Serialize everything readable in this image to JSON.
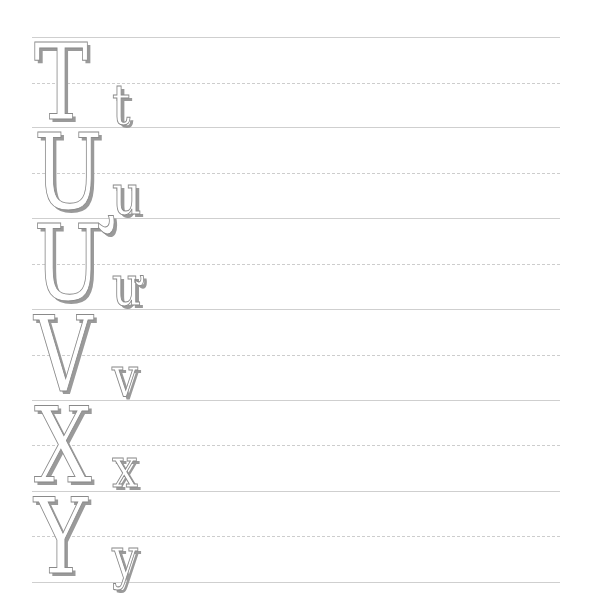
{
  "worksheet": {
    "rows": [
      {
        "upper": "T",
        "lower": "t"
      },
      {
        "upper": "U",
        "lower": "u"
      },
      {
        "upper": "Ư",
        "lower": "ư"
      },
      {
        "upper": "V",
        "lower": "v"
      },
      {
        "upper": "X",
        "lower": "x"
      },
      {
        "upper": "Y",
        "lower": "y"
      }
    ],
    "colors": {
      "line": "#cfcfcf",
      "dashed_line": "#cdcdcd",
      "letter_fill": "#ffffff",
      "letter_outline": "#8a8a8a",
      "letter_shadow": "#9a9a9a"
    }
  }
}
